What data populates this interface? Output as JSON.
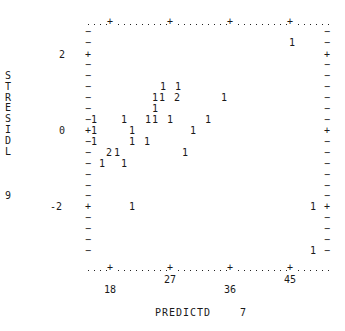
{
  "chart_data": {
    "type": "scatter",
    "title": "",
    "xlabel": "PREDICTD",
    "xlabel_suffix": "7",
    "ylabel": "STRESIDL",
    "ylabel_suffix": "9",
    "x_ticks": [
      {
        "label": "18",
        "px": 110,
        "label_row": "low"
      },
      {
        "label": "27",
        "px": 170,
        "label_row": "high"
      },
      {
        "label": "36",
        "px": 230,
        "label_row": "low"
      },
      {
        "label": "45",
        "px": 290,
        "label_row": "high"
      }
    ],
    "y_ticks": [
      {
        "label": "2",
        "py": 55
      },
      {
        "label": "0",
        "py": 131
      },
      {
        "label": "-2",
        "py": 207
      }
    ],
    "xlim": [
      14.7,
      50.9
    ],
    "ylim": [
      -3.3,
      2.9
    ],
    "grid": false,
    "legend": "none (counts printed as symbols)",
    "points": [
      {
        "sym": "1",
        "px": 292,
        "py": 43,
        "x": 45.3,
        "y": 2.3,
        "count": 1
      },
      {
        "sym": "1",
        "px": 163,
        "py": 87,
        "x": 26.0,
        "y": 1.15,
        "count": 1
      },
      {
        "sym": "1",
        "px": 178,
        "py": 87,
        "x": 28.2,
        "y": 1.15,
        "count": 1
      },
      {
        "sym": "1",
        "px": 155,
        "py": 98,
        "x": 24.8,
        "y": 0.86,
        "count": 1
      },
      {
        "sym": "1",
        "px": 162,
        "py": 98,
        "x": 25.8,
        "y": 0.86,
        "count": 1
      },
      {
        "sym": "2",
        "px": 177,
        "py": 98,
        "x": 28.1,
        "y": 0.86,
        "count": 2
      },
      {
        "sym": "1",
        "px": 224,
        "py": 98,
        "x": 35.1,
        "y": 0.86,
        "count": 1
      },
      {
        "sym": "1",
        "px": 155,
        "py": 109,
        "x": 24.8,
        "y": 0.57,
        "count": 1
      },
      {
        "sym": "1",
        "px": 94,
        "py": 120,
        "x": 15.6,
        "y": 0.29,
        "count": 1
      },
      {
        "sym": "1",
        "px": 124,
        "py": 120,
        "x": 20.1,
        "y": 0.29,
        "count": 1
      },
      {
        "sym": "1",
        "px": 148,
        "py": 120,
        "x": 23.7,
        "y": 0.29,
        "count": 1
      },
      {
        "sym": "1",
        "px": 155,
        "py": 120,
        "x": 24.8,
        "y": 0.29,
        "count": 1
      },
      {
        "sym": "1",
        "px": 170,
        "py": 120,
        "x": 27.0,
        "y": 0.29,
        "count": 1
      },
      {
        "sym": "1",
        "px": 208,
        "py": 120,
        "x": 32.7,
        "y": 0.29,
        "count": 1
      },
      {
        "sym": "1",
        "px": 94,
        "py": 131,
        "x": 15.6,
        "y": 0.0,
        "count": 1
      },
      {
        "sym": "1",
        "px": 132,
        "py": 131,
        "x": 21.3,
        "y": 0.0,
        "count": 1
      },
      {
        "sym": "1",
        "px": 193,
        "py": 131,
        "x": 30.5,
        "y": 0.0,
        "count": 1
      },
      {
        "sym": "1",
        "px": 94,
        "py": 142,
        "x": 15.6,
        "y": -0.29,
        "count": 1
      },
      {
        "sym": "1",
        "px": 132,
        "py": 142,
        "x": 21.3,
        "y": -0.29,
        "count": 1
      },
      {
        "sym": "1",
        "px": 147,
        "py": 142,
        "x": 23.6,
        "y": -0.29,
        "count": 1
      },
      {
        "sym": "2",
        "px": 109,
        "py": 153,
        "x": 17.9,
        "y": -0.57,
        "count": 2
      },
      {
        "sym": "1",
        "px": 117,
        "py": 153,
        "x": 19.1,
        "y": -0.57,
        "count": 1
      },
      {
        "sym": "1",
        "px": 185,
        "py": 153,
        "x": 29.3,
        "y": -0.57,
        "count": 1
      },
      {
        "sym": "1",
        "px": 102,
        "py": 164,
        "x": 16.8,
        "y": -0.86,
        "count": 1
      },
      {
        "sym": "1",
        "px": 124,
        "py": 164,
        "x": 20.1,
        "y": -0.86,
        "count": 1
      },
      {
        "sym": "1",
        "px": 132,
        "py": 207,
        "x": 21.3,
        "y": -2.0,
        "count": 1
      },
      {
        "sym": "1",
        "px": 313,
        "py": 207,
        "x": 48.5,
        "y": -2.0,
        "count": 1
      },
      {
        "sym": "1",
        "px": 313,
        "py": 251,
        "x": 48.5,
        "y": -3.15,
        "count": 1
      }
    ]
  },
  "frame": {
    "left_px": 88,
    "right_px": 327,
    "top_py": 22,
    "bottom_py": 268,
    "row_py": [
      32,
      43,
      55,
      65,
      76,
      87,
      98,
      109,
      120,
      131,
      142,
      153,
      164,
      175,
      186,
      196,
      207,
      218,
      229,
      240,
      251
    ],
    "plus_rows": [
      55,
      131,
      207
    ],
    "plus_cols": [
      110,
      170,
      230,
      290
    ]
  },
  "labels": {
    "ylabel_letters": [
      "S",
      "T",
      "R",
      "E",
      "S",
      "I",
      "D",
      "L"
    ],
    "ylabel_suffix": "9",
    "xlabel": "PREDICTD",
    "xlabel_suffix": "7"
  }
}
